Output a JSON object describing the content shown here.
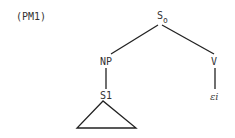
{
  "diagram": {
    "label": "(PM1)",
    "type": "syntax-tree",
    "nodes": [
      {
        "id": "S0",
        "text": "S",
        "subscript": "o"
      },
      {
        "id": "NP",
        "text": "NP"
      },
      {
        "id": "V",
        "text": "V"
      },
      {
        "id": "S1",
        "text": "S1"
      },
      {
        "id": "ei",
        "text": "εi"
      }
    ],
    "edges": [
      {
        "from": "S0",
        "to": "NP"
      },
      {
        "from": "S0",
        "to": "V"
      },
      {
        "from": "NP",
        "to": "S1"
      },
      {
        "from": "V",
        "to": "ei"
      }
    ],
    "triangle_under": "S1"
  }
}
